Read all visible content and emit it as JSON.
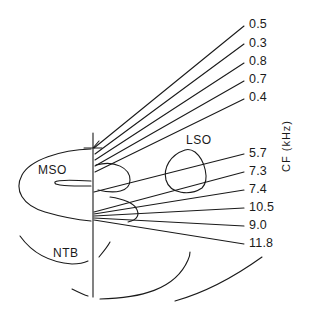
{
  "diagram": {
    "axis_label": "CF (kHz)",
    "regions": {
      "mso": "MSO",
      "lso": "LSO",
      "ntb": "NTB"
    },
    "upper_cf_labels": [
      "0.5",
      "0.3",
      "0.8",
      "0.7",
      "0.4"
    ],
    "lower_cf_labels": [
      "5.7",
      "7.3",
      "7.4",
      "10.5",
      "9.0",
      "11.8"
    ],
    "colors": {
      "line": "#1a1a1a",
      "background": "#ffffff"
    }
  }
}
